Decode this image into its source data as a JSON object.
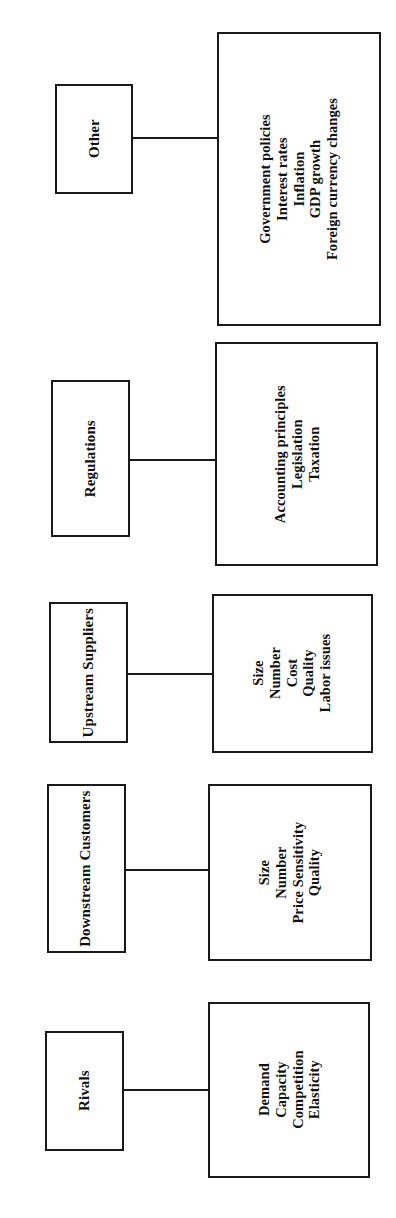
{
  "diagram": {
    "type": "hierarchy-branches",
    "orientation": "rotated-90-ccw",
    "background_color": "#ffffff",
    "line_color": "#1a1a1a",
    "text_color": "#111111",
    "groups": [
      {
        "id": "other",
        "category": "Other",
        "details": [
          "Government policies",
          "Interest rates",
          "Inflation",
          "GDP growth",
          "Foreign currency changes"
        ]
      },
      {
        "id": "regulations",
        "category": "Regulations",
        "details": [
          "Accounting principles",
          "Legislation",
          "Taxation"
        ]
      },
      {
        "id": "upstream",
        "category": "Upstream\nSuppliers",
        "category_line1": "Upstream",
        "category_line2": "Suppliers",
        "details": [
          "Size",
          "Number",
          "Cost",
          "Quality",
          "Labor issues"
        ]
      },
      {
        "id": "downstream",
        "category": "Downstream\nCustomers",
        "category_line1": "Downstream",
        "category_line2": "Customers",
        "details": [
          "Size",
          "Number",
          "Price Sensitivity",
          "Quality"
        ]
      },
      {
        "id": "rivals",
        "category": "Rivals",
        "details": [
          "Demand",
          "Capacity",
          "Competition",
          "Elasticity"
        ]
      }
    ]
  }
}
